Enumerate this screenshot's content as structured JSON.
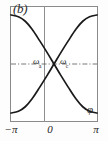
{
  "figure": {
    "panel_label": "(b)",
    "x_axis": {
      "label": "φ",
      "ticks": [
        "−π",
        "0",
        "π"
      ],
      "range": [
        -3.14159,
        3.14159
      ]
    },
    "annotations": [
      {
        "id": "omega-left",
        "base": "ω",
        "subscript": "a"
      },
      {
        "id": "omega-right",
        "base": "ω",
        "subscript": "c"
      }
    ],
    "colors": {
      "curve": "#1a1a1a",
      "frame": "#8a8a8a",
      "axis": "#8f8f8f",
      "guide": "#6a6a6a",
      "background": "#ffffff"
    }
  },
  "chart_data": {
    "type": "line",
    "title": "(b)",
    "xlabel": "φ",
    "ylabel": "",
    "xlim": [
      -3.14159,
      3.14159
    ],
    "ylim": [
      0,
      1
    ],
    "grid": false,
    "legend": null,
    "xticks": [
      -3.14159,
      0,
      3.14159
    ],
    "xticklabels": [
      "−π",
      "0",
      "π"
    ],
    "crossing_point": {
      "x": 0,
      "y": 0.5
    },
    "guide_line": {
      "orientation": "horizontal",
      "y": 0.5,
      "style": "dash-dot"
    },
    "center_line": {
      "orientation": "vertical",
      "x": 0,
      "style": "solid"
    },
    "series": [
      {
        "name": "ω_a",
        "label": "ωₐ",
        "x": [
          -3.14159,
          -2.6,
          -2.1,
          -1.6,
          -1.05,
          -0.5,
          0,
          0.5,
          1.05,
          1.6,
          2.1,
          2.6,
          3.14159
        ],
        "values": [
          0.93,
          0.915,
          0.875,
          0.805,
          0.705,
          0.6,
          0.5,
          0.4,
          0.295,
          0.195,
          0.125,
          0.085,
          0.07
        ]
      },
      {
        "name": "ω_c",
        "label": "ωᴄ",
        "x": [
          -3.14159,
          -2.6,
          -2.1,
          -1.6,
          -1.05,
          -0.5,
          0,
          0.5,
          1.05,
          1.6,
          2.1,
          2.6,
          3.14159
        ],
        "values": [
          0.07,
          0.085,
          0.125,
          0.195,
          0.295,
          0.4,
          0.5,
          0.6,
          0.705,
          0.805,
          0.875,
          0.915,
          0.93
        ]
      }
    ]
  }
}
